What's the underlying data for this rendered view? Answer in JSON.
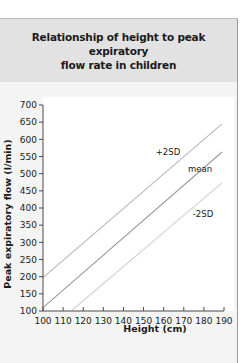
{
  "header": {
    "title_line1": "Relationship of height to peak expiratory",
    "title_line2": "flow rate in children"
  },
  "colors": {
    "panel_bg": "#f4f4f4",
    "header_bg": "#e2e2e2",
    "plot_bg": "#ffffff",
    "axis": "#4a4a4a",
    "line_plus2sd": "#b8b8b8",
    "line_mean": "#9a9a9a",
    "line_minus2sd": "#d2d2d2",
    "text": "#1a1a1a"
  },
  "chart_data": {
    "type": "line",
    "title": "Relationship of height to peak expiratory flow rate in children",
    "xlabel": "Height (cm)",
    "ylabel": "Peak expiratory flow (l/min)",
    "xlim": [
      100,
      190
    ],
    "ylim": [
      100,
      700
    ],
    "x_ticks": [
      "100",
      "110",
      "120",
      "130",
      "140",
      "150",
      "160",
      "170",
      "180",
      "190"
    ],
    "y_ticks": [
      "100",
      "150",
      "200",
      "250",
      "300",
      "350",
      "400",
      "450",
      "500",
      "550",
      "600",
      "650",
      "700"
    ],
    "grid": false,
    "legend": "inline labels",
    "series": [
      {
        "name": "+2SD",
        "label": "+2SD",
        "x": [
          100,
          189
        ],
        "y": [
          197,
          645
        ]
      },
      {
        "name": "mean",
        "label": "mean",
        "x": [
          100,
          189
        ],
        "y": [
          110,
          563
        ]
      },
      {
        "name": "-2SD",
        "label": "-2SD",
        "x": [
          114,
          189
        ],
        "y": [
          100,
          473
        ]
      }
    ]
  }
}
